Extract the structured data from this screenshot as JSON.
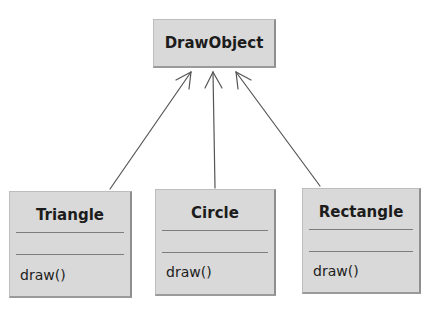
{
  "diagram": {
    "type": "uml-class-inheritance",
    "parent": {
      "name": "DrawObject"
    },
    "children": [
      {
        "name": "Triangle",
        "attributes": [],
        "operations": [
          "draw()"
        ]
      },
      {
        "name": "Circle",
        "attributes": [],
        "operations": [
          "draw()"
        ]
      },
      {
        "name": "Rectangle",
        "attributes": [],
        "operations": [
          "draw()"
        ]
      }
    ],
    "relations": [
      {
        "from": "Triangle",
        "to": "DrawObject",
        "kind": "generalization"
      },
      {
        "from": "Circle",
        "to": "DrawObject",
        "kind": "generalization"
      },
      {
        "from": "Rectangle",
        "to": "DrawObject",
        "kind": "generalization"
      }
    ],
    "colors": {
      "box_fill": "#d9d9d9",
      "box_shadow": "#8f8f8f",
      "line": "#555555",
      "text": "#1c1c1c"
    }
  }
}
